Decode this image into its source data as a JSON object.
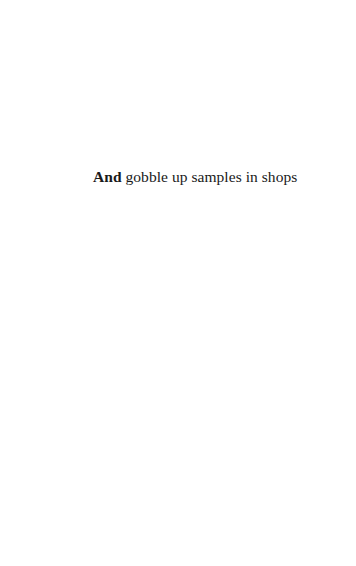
{
  "page": {
    "text_line": {
      "lead_word": "And",
      "rest": " gobble up samples in shops"
    }
  }
}
